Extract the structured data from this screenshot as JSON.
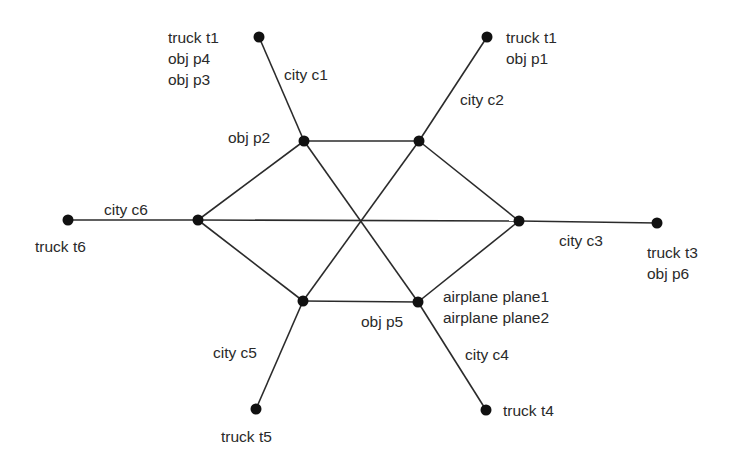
{
  "diagram": {
    "type": "logistics-network",
    "colors": {
      "edge": "#2b2b2b",
      "node": "#111111",
      "text": "#2a2a2a",
      "background": "#ffffff"
    },
    "nodes": [
      {
        "id": "c1-hub",
        "x": 304,
        "y": 141
      },
      {
        "id": "c1-out",
        "x": 259,
        "y": 37
      },
      {
        "id": "c2-hub",
        "x": 419,
        "y": 141
      },
      {
        "id": "c2-out",
        "x": 487,
        "y": 37
      },
      {
        "id": "c3-hub",
        "x": 519,
        "y": 221
      },
      {
        "id": "c3-out",
        "x": 657,
        "y": 223
      },
      {
        "id": "c4-hub",
        "x": 418,
        "y": 302
      },
      {
        "id": "c4-out",
        "x": 486,
        "y": 410
      },
      {
        "id": "c5-hub",
        "x": 303,
        "y": 301
      },
      {
        "id": "c5-out",
        "x": 256,
        "y": 409
      },
      {
        "id": "c6-hub",
        "x": 198,
        "y": 220
      },
      {
        "id": "c6-out",
        "x": 68,
        "y": 220
      }
    ],
    "edges": [
      [
        "c1-hub",
        "c1-out"
      ],
      [
        "c2-hub",
        "c2-out"
      ],
      [
        "c3-hub",
        "c3-out"
      ],
      [
        "c4-hub",
        "c4-out"
      ],
      [
        "c5-hub",
        "c5-out"
      ],
      [
        "c6-hub",
        "c6-out"
      ],
      [
        "c1-hub",
        "c2-hub"
      ],
      [
        "c2-hub",
        "c3-hub"
      ],
      [
        "c3-hub",
        "c4-hub"
      ],
      [
        "c4-hub",
        "c5-hub"
      ],
      [
        "c5-hub",
        "c6-hub"
      ],
      [
        "c6-hub",
        "c1-hub"
      ],
      [
        "c1-hub",
        "c4-hub"
      ],
      [
        "c2-hub",
        "c5-hub"
      ],
      [
        "c6-hub",
        "c3-hub"
      ]
    ],
    "labels": [
      {
        "id": "c1-out-items",
        "x": 168,
        "y": 27,
        "lines": [
          "truck t1",
          "obj p4",
          "obj p3"
        ]
      },
      {
        "id": "c1-city",
        "x": 284,
        "y": 64,
        "lines": [
          "city c1"
        ]
      },
      {
        "id": "c1-hub-items",
        "x": 228,
        "y": 127,
        "lines": [
          "obj p2"
        ]
      },
      {
        "id": "c2-out-items",
        "x": 506,
        "y": 27,
        "lines": [
          "truck t1",
          "obj p1"
        ]
      },
      {
        "id": "c2-city",
        "x": 460,
        "y": 89,
        "lines": [
          "city c2"
        ]
      },
      {
        "id": "c6-city",
        "x": 104,
        "y": 199,
        "lines": [
          "city c6"
        ]
      },
      {
        "id": "c6-out-items",
        "x": 35,
        "y": 236,
        "lines": [
          "truck t6"
        ]
      },
      {
        "id": "c3-city",
        "x": 559,
        "y": 230,
        "lines": [
          "city c3"
        ]
      },
      {
        "id": "c3-out-items",
        "x": 647,
        "y": 242,
        "lines": [
          "truck t3",
          "obj p6"
        ]
      },
      {
        "id": "c4-hub-items",
        "x": 443,
        "y": 286,
        "lines": [
          "airplane plane1",
          "airplane plane2"
        ]
      },
      {
        "id": "c4-hub-below",
        "x": 361,
        "y": 311,
        "lines": [
          "obj p5"
        ]
      },
      {
        "id": "c5-city",
        "x": 213,
        "y": 342,
        "lines": [
          "city c5"
        ]
      },
      {
        "id": "c4-city",
        "x": 465,
        "y": 344,
        "lines": [
          "city c4"
        ]
      },
      {
        "id": "c4-out-items",
        "x": 503,
        "y": 400,
        "lines": [
          "truck t4"
        ]
      },
      {
        "id": "c5-out-items",
        "x": 221,
        "y": 426,
        "lines": [
          "truck t5"
        ]
      }
    ]
  }
}
